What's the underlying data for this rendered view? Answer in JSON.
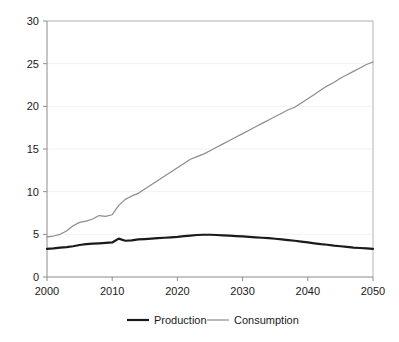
{
  "chart_data": {
    "type": "line",
    "title": "",
    "xlabel": "",
    "ylabel": "",
    "xlim": [
      2000,
      2050
    ],
    "ylim": [
      0,
      30
    ],
    "xticks": [
      2000,
      2010,
      2020,
      2030,
      2040,
      2050
    ],
    "xtick_labels": [
      "2000",
      "2010",
      "2020",
      "2030",
      "2040",
      "2050"
    ],
    "yticks": [
      0,
      5,
      10,
      15,
      20,
      25,
      30
    ],
    "ytick_labels": [
      "0",
      "5",
      "10",
      "15",
      "20",
      "25",
      "30"
    ],
    "grid": "horizontal",
    "legend_position": "bottom-center",
    "x": [
      2000,
      2001,
      2002,
      2003,
      2004,
      2005,
      2006,
      2007,
      2008,
      2009,
      2010,
      2011,
      2012,
      2013,
      2014,
      2015,
      2016,
      2017,
      2018,
      2019,
      2020,
      2021,
      2022,
      2023,
      2024,
      2025,
      2026,
      2027,
      2028,
      2029,
      2030,
      2031,
      2032,
      2033,
      2034,
      2035,
      2036,
      2037,
      2038,
      2039,
      2040,
      2041,
      2042,
      2043,
      2044,
      2045,
      2046,
      2047,
      2048,
      2049,
      2050
    ],
    "series": [
      {
        "name": "Production",
        "color": "#1a1a1a",
        "width": 2.2,
        "values": [
          3.3,
          3.35,
          3.45,
          3.5,
          3.6,
          3.75,
          3.85,
          3.9,
          3.95,
          4.0,
          4.05,
          4.5,
          4.25,
          4.3,
          4.4,
          4.45,
          4.5,
          4.55,
          4.6,
          4.65,
          4.7,
          4.78,
          4.85,
          4.92,
          4.95,
          4.95,
          4.92,
          4.88,
          4.85,
          4.8,
          4.75,
          4.7,
          4.65,
          4.6,
          4.55,
          4.48,
          4.4,
          4.32,
          4.25,
          4.15,
          4.05,
          3.95,
          3.85,
          3.78,
          3.68,
          3.6,
          3.52,
          3.45,
          3.4,
          3.35,
          3.3
        ]
      },
      {
        "name": "Consumption",
        "color": "#8c8c8c",
        "width": 1.2,
        "values": [
          4.7,
          4.8,
          5.0,
          5.4,
          6.0,
          6.4,
          6.55,
          6.8,
          7.2,
          7.1,
          7.3,
          8.4,
          9.1,
          9.5,
          9.8,
          10.3,
          10.8,
          11.3,
          11.8,
          12.3,
          12.8,
          13.3,
          13.8,
          14.1,
          14.4,
          14.8,
          15.2,
          15.6,
          16.0,
          16.4,
          16.8,
          17.2,
          17.6,
          18.0,
          18.4,
          18.8,
          19.2,
          19.6,
          19.9,
          20.4,
          20.9,
          21.4,
          21.9,
          22.4,
          22.8,
          23.3,
          23.7,
          24.1,
          24.5,
          24.9,
          25.2
        ]
      }
    ]
  },
  "legend": {
    "items": [
      {
        "label": "Production",
        "color": "#1a1a1a"
      },
      {
        "label": "Consumption",
        "color": "#8c8c8c"
      }
    ]
  },
  "style": {
    "grid_color": "#f2f2f2",
    "axis_color": "#8c8c8c",
    "border_color": "#b5b5b5",
    "text_color": "#1a1a1a",
    "background": "#ffffff"
  }
}
